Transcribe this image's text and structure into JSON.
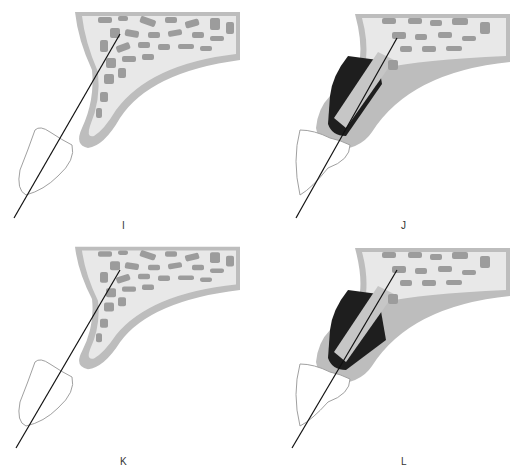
{
  "figure": {
    "panels": [
      {
        "id": "I",
        "label": "I",
        "state": "bone-only",
        "implant": false
      },
      {
        "id": "J",
        "label": "J",
        "state": "implant-placed",
        "implant": true
      },
      {
        "id": "K",
        "label": "K",
        "state": "bone-only",
        "implant": false
      },
      {
        "id": "L",
        "label": "L",
        "state": "implant-placed",
        "implant": true
      }
    ],
    "colors": {
      "cortical_bone": "#b9b9b9",
      "cancellous_bone": "#e6e6e6",
      "trabeculae": "#9a9a9a",
      "implant_socket": "#1e1e1e",
      "implant": "#c8c8c8",
      "axis_line": "#111111",
      "tooth_outline": "#999999"
    }
  }
}
